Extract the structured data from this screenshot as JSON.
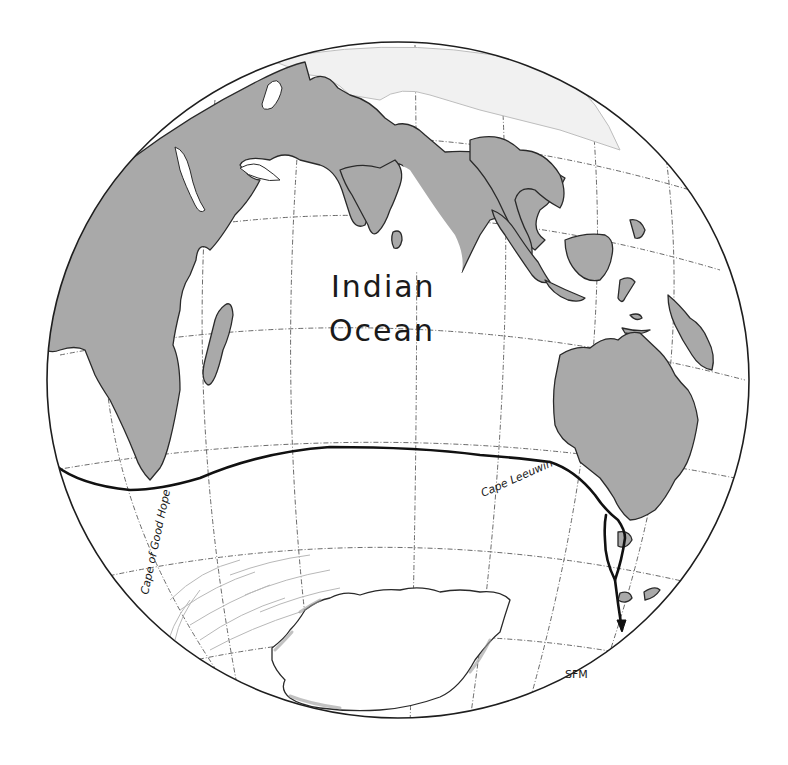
{
  "map": {
    "title_label": {
      "line1": "Indian",
      "line2": "Ocean"
    },
    "places": [
      {
        "id": "cape-of-good-hope",
        "label": "Cape of Good Hope"
      },
      {
        "id": "cape-leeuwin",
        "label": "Cape Leeuwin"
      }
    ],
    "signature": "SFM",
    "projection": "orthographic globe",
    "features": {
      "landmasses": [
        "Africa",
        "Madagascar",
        "Arabia",
        "India",
        "Sri Lanka",
        "Southeast Asia",
        "Sumatra",
        "Borneo",
        "Sulawesi",
        "New Guinea",
        "Australia",
        "Tasmania",
        "New Zealand",
        "Antarctica"
      ],
      "route": "Cape of Good Hope → Cape Leeuwin → around Tasmania → south",
      "graticule": "dash-dot meridians and parallels"
    },
    "colors": {
      "land": "#a9a9a9",
      "outline": "#2a2a2a",
      "route": "#111111",
      "background": "#ffffff"
    }
  }
}
